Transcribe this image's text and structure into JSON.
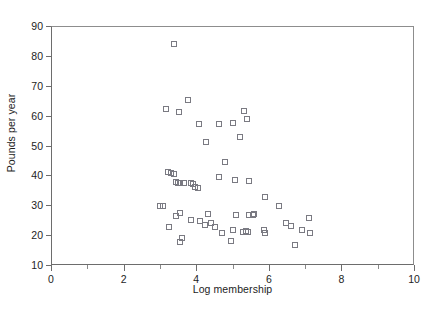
{
  "chart_data": {
    "type": "scatter",
    "title": "",
    "xlabel": "Log membership",
    "ylabel": "Pounds per year",
    "xlim": [
      0,
      10
    ],
    "ylim": [
      10,
      90
    ],
    "grid": false,
    "legend": null,
    "marker": "open-square",
    "marker_color": "#7a7a82",
    "xticks": [
      0,
      2,
      4,
      6,
      8,
      10
    ],
    "xticks_minor": [
      1,
      3,
      5,
      7,
      9
    ],
    "yticks": [
      10,
      20,
      30,
      40,
      50,
      60,
      70,
      80,
      90
    ],
    "points": [
      {
        "x": 3.4,
        "y": 84.1
      },
      {
        "x": 3.78,
        "y": 65.2
      },
      {
        "x": 3.18,
        "y": 62.3
      },
      {
        "x": 3.52,
        "y": 61.3
      },
      {
        "x": 5.32,
        "y": 61.6
      },
      {
        "x": 4.08,
        "y": 57.2
      },
      {
        "x": 5.02,
        "y": 57.6
      },
      {
        "x": 4.62,
        "y": 57.3
      },
      {
        "x": 5.4,
        "y": 58.8
      },
      {
        "x": 4.28,
        "y": 51.2
      },
      {
        "x": 5.22,
        "y": 52.8
      },
      {
        "x": 4.78,
        "y": 44.4
      },
      {
        "x": 4.62,
        "y": 39.4
      },
      {
        "x": 5.06,
        "y": 38.6
      },
      {
        "x": 5.46,
        "y": 38.0
      },
      {
        "x": 3.22,
        "y": 41.2
      },
      {
        "x": 3.3,
        "y": 40.9
      },
      {
        "x": 3.4,
        "y": 40.4
      },
      {
        "x": 3.44,
        "y": 37.8
      },
      {
        "x": 3.5,
        "y": 37.6
      },
      {
        "x": 3.56,
        "y": 37.4
      },
      {
        "x": 3.66,
        "y": 37.5
      },
      {
        "x": 3.86,
        "y": 37.4
      },
      {
        "x": 3.92,
        "y": 37.2
      },
      {
        "x": 3.98,
        "y": 36.2
      },
      {
        "x": 4.04,
        "y": 35.8
      },
      {
        "x": 5.9,
        "y": 32.6
      },
      {
        "x": 3.0,
        "y": 29.7
      },
      {
        "x": 3.08,
        "y": 29.6
      },
      {
        "x": 6.28,
        "y": 29.8
      },
      {
        "x": 3.56,
        "y": 27.5
      },
      {
        "x": 4.32,
        "y": 27.0
      },
      {
        "x": 5.1,
        "y": 26.8
      },
      {
        "x": 5.46,
        "y": 26.6
      },
      {
        "x": 5.56,
        "y": 26.8
      },
      {
        "x": 5.58,
        "y": 27.2
      },
      {
        "x": 7.12,
        "y": 25.8
      },
      {
        "x": 3.44,
        "y": 26.4
      },
      {
        "x": 3.86,
        "y": 25.2
      },
      {
        "x": 4.1,
        "y": 24.6
      },
      {
        "x": 4.24,
        "y": 23.4
      },
      {
        "x": 4.4,
        "y": 24.2
      },
      {
        "x": 6.48,
        "y": 24.0
      },
      {
        "x": 6.62,
        "y": 23.0
      },
      {
        "x": 3.24,
        "y": 22.8
      },
      {
        "x": 4.52,
        "y": 22.6
      },
      {
        "x": 5.02,
        "y": 21.6
      },
      {
        "x": 5.3,
        "y": 21.2
      },
      {
        "x": 5.38,
        "y": 21.4
      },
      {
        "x": 5.42,
        "y": 21.0
      },
      {
        "x": 5.88,
        "y": 21.8
      },
      {
        "x": 5.9,
        "y": 20.8
      },
      {
        "x": 6.92,
        "y": 21.6
      },
      {
        "x": 7.14,
        "y": 20.6
      },
      {
        "x": 4.7,
        "y": 20.6
      },
      {
        "x": 3.6,
        "y": 19.0
      },
      {
        "x": 3.54,
        "y": 17.6
      },
      {
        "x": 4.96,
        "y": 18.0
      },
      {
        "x": 6.72,
        "y": 16.6
      }
    ]
  },
  "caption": ""
}
